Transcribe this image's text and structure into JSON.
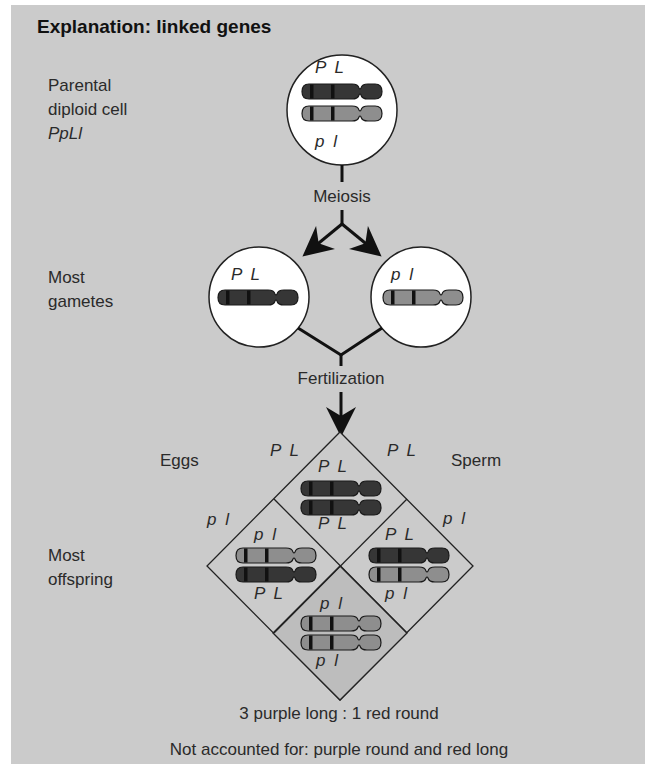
{
  "title": "Explanation: linked genes",
  "labels": {
    "parental_line1": "Parental",
    "parental_line2": "diploid cell",
    "parental_genotype": "PpLl",
    "gametes_line1": "Most",
    "gametes_line2": "gametes",
    "offspring_line1": "Most",
    "offspring_line2": "offspring",
    "eggs": "Eggs",
    "sperm": "Sperm",
    "meiosis": "Meiosis",
    "fertilization": "Fertilization"
  },
  "parental_cell": {
    "top_allele": "P L",
    "bottom_allele": "p l"
  },
  "gametes": [
    {
      "allele": "P L",
      "chromosome": "dark"
    },
    {
      "allele": "p l",
      "chromosome": "light"
    }
  ],
  "punnett": {
    "egg_labels": [
      "P L",
      "p l"
    ],
    "sperm_labels": [
      "P L",
      "p l"
    ],
    "cells": [
      {
        "position": "top",
        "top_label": "P L",
        "bottom_label": "P L",
        "chromosomes": [
          "dark",
          "dark"
        ]
      },
      {
        "position": "left",
        "top_label": "p l",
        "bottom_label": "P L",
        "chromosomes": [
          "light",
          "dark"
        ]
      },
      {
        "position": "right",
        "top_label": "P L",
        "bottom_label": "p l",
        "chromosomes": [
          "dark",
          "light"
        ]
      },
      {
        "position": "bottom",
        "top_label": "p l",
        "bottom_label": "p l",
        "chromosomes": [
          "light",
          "light"
        ]
      }
    ]
  },
  "result": "3 purple long : 1 red round",
  "note": "Not accounted for: purple round and red long",
  "colors": {
    "panel": "#cbcbcb",
    "dark_chromosome": "#363636",
    "light_chromosome": "#8e8e8e",
    "band": "#111111",
    "bottom_cell": "#bdbdbd"
  }
}
